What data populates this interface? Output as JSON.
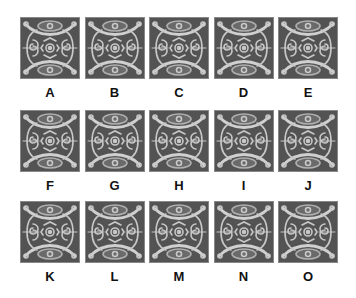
{
  "puzzle": {
    "options": [
      {
        "label": "A"
      },
      {
        "label": "B"
      },
      {
        "label": "C"
      },
      {
        "label": "D"
      },
      {
        "label": "E"
      },
      {
        "label": "F"
      },
      {
        "label": "G"
      },
      {
        "label": "H"
      },
      {
        "label": "I"
      },
      {
        "label": "J"
      },
      {
        "label": "K"
      },
      {
        "label": "L"
      },
      {
        "label": "M"
      },
      {
        "label": "N"
      },
      {
        "label": "O"
      }
    ],
    "colors": {
      "tile_bg": "#535353",
      "ornament": "#c8c8c8",
      "label": "#111111"
    }
  }
}
